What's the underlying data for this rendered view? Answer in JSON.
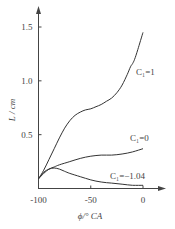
{
  "chart_data": {
    "type": "line",
    "title": "",
    "xlabel": "ϕ/° CA",
    "ylabel": "L / cm",
    "xlim": [
      -100,
      0
    ],
    "ylim": [
      0,
      1.6
    ],
    "xticks": [
      -100,
      -50,
      0
    ],
    "xtick_labels": [
      "-100",
      "-50",
      "0"
    ],
    "yticks": [
      0.5,
      1.0,
      1.5
    ],
    "ytick_labels": [
      "0.5",
      "1.0",
      "1.5"
    ],
    "grid": false,
    "legend": "inline labels",
    "series": [
      {
        "name": "C1=1",
        "label": "C₁=1",
        "x": [
          -100,
          -95,
          -90,
          -85,
          -80,
          -75,
          -70,
          -65,
          -60,
          -55,
          -50,
          -45,
          -40,
          -35,
          -30,
          -25,
          -20,
          -15,
          -12,
          -10,
          -8,
          -5,
          0
        ],
        "y": [
          0.09,
          0.17,
          0.27,
          0.37,
          0.47,
          0.56,
          0.63,
          0.68,
          0.71,
          0.73,
          0.74,
          0.76,
          0.78,
          0.81,
          0.84,
          0.89,
          0.96,
          1.06,
          1.13,
          1.16,
          1.2,
          1.29,
          1.45
        ]
      },
      {
        "name": "C1=0",
        "label": "C₁=0",
        "x": [
          -100,
          -95,
          -90,
          -85,
          -80,
          -70,
          -60,
          -50,
          -40,
          -30,
          -20,
          -10,
          0
        ],
        "y": [
          0.09,
          0.14,
          0.18,
          0.2,
          0.22,
          0.25,
          0.28,
          0.3,
          0.31,
          0.31,
          0.32,
          0.34,
          0.37
        ]
      },
      {
        "name": "C1=-1.04",
        "label": "C₁=−1.04",
        "x": [
          -100,
          -95,
          -90,
          -85,
          -80,
          -75,
          -70,
          -60,
          -50,
          -40,
          -30,
          -20,
          -10,
          0
        ],
        "y": [
          0.09,
          0.15,
          0.18,
          0.19,
          0.18,
          0.16,
          0.14,
          0.11,
          0.08,
          0.06,
          0.05,
          0.04,
          0.03,
          0.03
        ]
      }
    ]
  }
}
